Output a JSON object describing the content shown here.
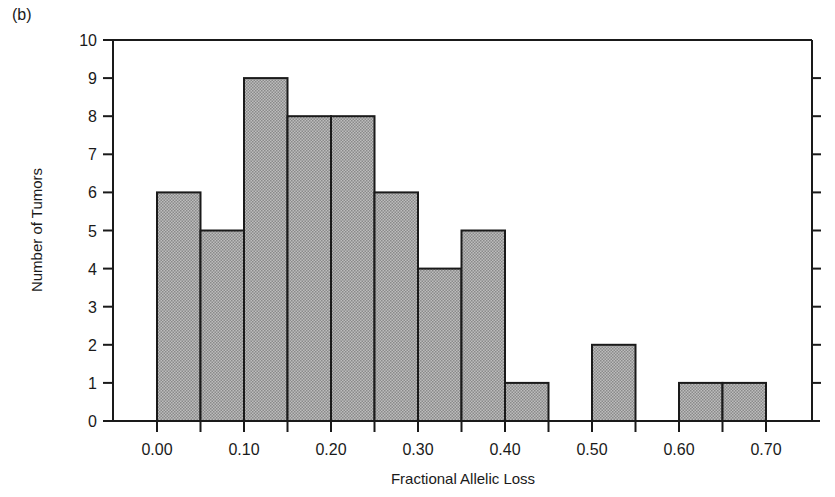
{
  "panel_label": "(b)",
  "chart_data": {
    "type": "bar",
    "subtype": "histogram",
    "title": "",
    "xlabel": "Fractional Allelic Loss",
    "ylabel": "Number of Tumors",
    "bin_width": 0.05,
    "bins": [
      {
        "start": 0.0,
        "end": 0.05,
        "count": 6
      },
      {
        "start": 0.05,
        "end": 0.1,
        "count": 5
      },
      {
        "start": 0.1,
        "end": 0.15,
        "count": 9
      },
      {
        "start": 0.15,
        "end": 0.2,
        "count": 8
      },
      {
        "start": 0.2,
        "end": 0.25,
        "count": 8
      },
      {
        "start": 0.25,
        "end": 0.3,
        "count": 6
      },
      {
        "start": 0.3,
        "end": 0.35,
        "count": 4
      },
      {
        "start": 0.35,
        "end": 0.4,
        "count": 5
      },
      {
        "start": 0.4,
        "end": 0.45,
        "count": 1
      },
      {
        "start": 0.45,
        "end": 0.5,
        "count": 0
      },
      {
        "start": 0.5,
        "end": 0.55,
        "count": 2
      },
      {
        "start": 0.55,
        "end": 0.6,
        "count": 0
      },
      {
        "start": 0.6,
        "end": 0.65,
        "count": 1
      },
      {
        "start": 0.65,
        "end": 0.7,
        "count": 1
      }
    ],
    "categories": [
      "0.00",
      "0.05",
      "0.10",
      "0.15",
      "0.20",
      "0.25",
      "0.30",
      "0.35",
      "0.40",
      "0.45",
      "0.50",
      "0.55",
      "0.60",
      "0.65"
    ],
    "values": [
      6,
      5,
      9,
      8,
      8,
      6,
      4,
      5,
      1,
      0,
      2,
      0,
      1,
      1
    ],
    "x_tick_labels": [
      "0.00",
      "0.10",
      "0.20",
      "0.30",
      "0.40",
      "0.50",
      "0.60",
      "0.70"
    ],
    "y_tick_labels": [
      "0",
      "1",
      "2",
      "3",
      "4",
      "5",
      "6",
      "7",
      "8",
      "9",
      "10"
    ],
    "ylim": [
      0,
      10
    ],
    "xlim": [
      -0.05,
      0.75
    ],
    "grid": false,
    "legend": null,
    "bar_fill": "#a8a8a8",
    "bar_edge": "#1a1a1a"
  }
}
